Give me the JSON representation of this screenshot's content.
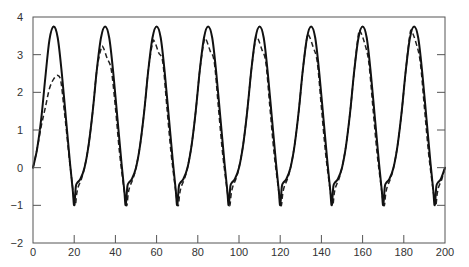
{
  "chart_data": {
    "type": "line",
    "title": "",
    "xlabel": "",
    "ylabel": "",
    "xlim": [
      0,
      200
    ],
    "ylim": [
      -2,
      4
    ],
    "grid": false,
    "legend": null,
    "x_ticks": [
      0,
      20,
      40,
      60,
      80,
      100,
      120,
      140,
      160,
      180,
      200
    ],
    "x_tick_labels": [
      "0",
      "20",
      "40",
      "60",
      "80",
      "100",
      "120",
      "140",
      "160",
      "180",
      "200"
    ],
    "y_ticks": [
      -2,
      -1,
      0,
      1,
      2,
      3,
      4
    ],
    "y_tick_labels": [
      "−2",
      "−1",
      "0",
      "1",
      "2",
      "3",
      "4"
    ],
    "series": [
      {
        "name": "solid",
        "style": "solid",
        "color": "#111111",
        "points": [
          [
            0,
            0
          ],
          [
            2,
            0.5
          ],
          [
            4,
            1.3
          ],
          [
            6,
            2.4
          ],
          [
            8,
            3.4
          ],
          [
            10,
            3.75
          ],
          [
            12,
            3.45
          ],
          [
            14,
            2.5
          ],
          [
            16,
            1.3
          ],
          [
            18,
            0.1
          ],
          [
            19.3,
            -0.6
          ],
          [
            20,
            -1.0
          ],
          [
            20.8,
            -0.5
          ],
          [
            21.5,
            -0.4
          ],
          [
            23,
            -0.3
          ],
          [
            25,
            0.0
          ],
          [
            27,
            0.6
          ],
          [
            29,
            1.5
          ],
          [
            31,
            2.6
          ],
          [
            33,
            3.45
          ],
          [
            35,
            3.75
          ],
          [
            37,
            3.45
          ],
          [
            39,
            2.5
          ],
          [
            41,
            1.3
          ],
          [
            43,
            0.1
          ],
          [
            44.3,
            -0.6
          ],
          [
            45,
            -1.0
          ],
          [
            45.8,
            -0.5
          ],
          [
            46.5,
            -0.4
          ],
          [
            48,
            -0.3
          ],
          [
            50,
            0.0
          ],
          [
            52,
            0.6
          ],
          [
            54,
            1.5
          ],
          [
            56,
            2.6
          ],
          [
            58,
            3.45
          ],
          [
            60,
            3.75
          ],
          [
            62,
            3.45
          ],
          [
            64,
            2.5
          ],
          [
            66,
            1.3
          ],
          [
            68,
            0.1
          ],
          [
            69.3,
            -0.6
          ],
          [
            70,
            -1.0
          ],
          [
            70.8,
            -0.5
          ],
          [
            71.5,
            -0.4
          ],
          [
            73,
            -0.3
          ],
          [
            75,
            0.0
          ],
          [
            77,
            0.6
          ],
          [
            79,
            1.5
          ],
          [
            81,
            2.6
          ],
          [
            83,
            3.45
          ],
          [
            85,
            3.75
          ],
          [
            87,
            3.45
          ],
          [
            89,
            2.5
          ],
          [
            91,
            1.3
          ],
          [
            93,
            0.1
          ],
          [
            94.3,
            -0.6
          ],
          [
            95,
            -1.0
          ],
          [
            95.8,
            -0.5
          ],
          [
            96.5,
            -0.4
          ],
          [
            98,
            -0.3
          ],
          [
            100,
            0.0
          ],
          [
            102,
            0.6
          ],
          [
            104,
            1.5
          ],
          [
            106,
            2.6
          ],
          [
            108,
            3.45
          ],
          [
            110,
            3.75
          ],
          [
            112,
            3.45
          ],
          [
            114,
            2.5
          ],
          [
            116,
            1.3
          ],
          [
            118,
            0.1
          ],
          [
            119.3,
            -0.6
          ],
          [
            120,
            -1.0
          ],
          [
            120.8,
            -0.5
          ],
          [
            121.5,
            -0.4
          ],
          [
            123,
            -0.3
          ],
          [
            125,
            0.0
          ],
          [
            127,
            0.6
          ],
          [
            129,
            1.5
          ],
          [
            131,
            2.6
          ],
          [
            133,
            3.45
          ],
          [
            135,
            3.75
          ],
          [
            137,
            3.45
          ],
          [
            139,
            2.5
          ],
          [
            141,
            1.3
          ],
          [
            143,
            0.1
          ],
          [
            144.3,
            -0.6
          ],
          [
            145,
            -1.0
          ],
          [
            145.8,
            -0.5
          ],
          [
            146.5,
            -0.4
          ],
          [
            148,
            -0.3
          ],
          [
            150,
            0.0
          ],
          [
            152,
            0.6
          ],
          [
            154,
            1.5
          ],
          [
            156,
            2.6
          ],
          [
            158,
            3.45
          ],
          [
            160,
            3.75
          ],
          [
            162,
            3.45
          ],
          [
            164,
            2.5
          ],
          [
            166,
            1.3
          ],
          [
            168,
            0.1
          ],
          [
            169.3,
            -0.6
          ],
          [
            170,
            -1.0
          ],
          [
            170.8,
            -0.5
          ],
          [
            171.5,
            -0.4
          ],
          [
            173,
            -0.3
          ],
          [
            175,
            0.0
          ],
          [
            177,
            0.6
          ],
          [
            179,
            1.5
          ],
          [
            181,
            2.6
          ],
          [
            183,
            3.45
          ],
          [
            185,
            3.75
          ],
          [
            187,
            3.45
          ],
          [
            189,
            2.5
          ],
          [
            191,
            1.3
          ],
          [
            193,
            0.1
          ],
          [
            194.3,
            -0.6
          ],
          [
            195,
            -1.0
          ],
          [
            195.8,
            -0.5
          ],
          [
            196.5,
            -0.4
          ],
          [
            198,
            -0.3
          ],
          [
            200,
            0.0
          ]
        ]
      },
      {
        "name": "dashed",
        "style": "dashed",
        "color": "#222222",
        "points": [
          [
            0,
            0
          ],
          [
            2,
            0.5
          ],
          [
            4,
            1.1
          ],
          [
            6,
            1.6
          ],
          [
            8,
            2.1
          ],
          [
            10,
            2.35
          ],
          [
            12,
            2.45
          ],
          [
            13.5,
            2.3
          ],
          [
            15,
            1.6
          ],
          [
            16,
            1.1
          ],
          [
            17.5,
            0.3
          ],
          [
            19,
            -0.4
          ],
          [
            20,
            -0.9
          ],
          [
            20.6,
            -1.0
          ],
          [
            21.2,
            -0.7
          ],
          [
            22,
            -0.5
          ],
          [
            23.5,
            -0.3
          ],
          [
            25,
            0.0
          ],
          [
            27,
            0.6
          ],
          [
            29,
            1.5
          ],
          [
            31,
            2.6
          ],
          [
            33,
            3.15
          ],
          [
            34,
            3.2
          ],
          [
            36,
            2.9
          ],
          [
            38,
            2.6
          ],
          [
            40,
            1.6
          ],
          [
            42,
            0.4
          ],
          [
            44,
            -0.5
          ],
          [
            45,
            -0.9
          ],
          [
            45.6,
            -1.0
          ],
          [
            46.2,
            -0.7
          ],
          [
            47,
            -0.5
          ],
          [
            48.5,
            -0.3
          ],
          [
            50,
            0.0
          ],
          [
            52,
            0.6
          ],
          [
            54,
            1.5
          ],
          [
            56,
            2.6
          ],
          [
            58,
            3.3
          ],
          [
            59,
            3.35
          ],
          [
            61,
            3.05
          ],
          [
            63,
            2.8
          ],
          [
            65,
            1.6
          ],
          [
            67,
            0.4
          ],
          [
            69,
            -0.5
          ],
          [
            70,
            -0.9
          ],
          [
            70.6,
            -1.0
          ],
          [
            71.2,
            -0.7
          ],
          [
            72,
            -0.5
          ],
          [
            73.5,
            -0.3
          ],
          [
            75,
            0.0
          ],
          [
            77,
            0.6
          ],
          [
            79,
            1.5
          ],
          [
            81,
            2.6
          ],
          [
            83,
            3.35
          ],
          [
            84,
            3.4
          ],
          [
            86,
            3.1
          ],
          [
            88,
            2.8
          ],
          [
            90,
            1.6
          ],
          [
            92,
            0.4
          ],
          [
            94,
            -0.5
          ],
          [
            95,
            -0.9
          ],
          [
            95.6,
            -1.0
          ],
          [
            96.2,
            -0.7
          ],
          [
            97,
            -0.5
          ],
          [
            98.5,
            -0.3
          ],
          [
            100,
            0.0
          ],
          [
            102,
            0.6
          ],
          [
            104,
            1.5
          ],
          [
            106,
            2.6
          ],
          [
            108,
            3.4
          ],
          [
            109,
            3.45
          ],
          [
            111,
            3.15
          ],
          [
            113,
            2.8
          ],
          [
            115,
            1.6
          ],
          [
            117,
            0.4
          ],
          [
            119,
            -0.5
          ],
          [
            120,
            -0.9
          ],
          [
            120.6,
            -1.0
          ],
          [
            121.2,
            -0.7
          ],
          [
            122,
            -0.5
          ],
          [
            123.5,
            -0.3
          ],
          [
            125,
            0.0
          ],
          [
            127,
            0.6
          ],
          [
            129,
            1.5
          ],
          [
            131,
            2.6
          ],
          [
            133,
            3.45
          ],
          [
            134,
            3.5
          ],
          [
            136,
            3.2
          ],
          [
            138,
            2.8
          ],
          [
            140,
            1.6
          ],
          [
            142,
            0.4
          ],
          [
            144,
            -0.5
          ],
          [
            145,
            -0.9
          ],
          [
            145.6,
            -1.0
          ],
          [
            146.2,
            -0.7
          ],
          [
            147,
            -0.5
          ],
          [
            148.5,
            -0.3
          ],
          [
            150,
            0.0
          ],
          [
            152,
            0.6
          ],
          [
            154,
            1.5
          ],
          [
            156,
            2.6
          ],
          [
            158,
            3.55
          ],
          [
            159,
            3.6
          ],
          [
            161,
            3.3
          ],
          [
            163,
            2.8
          ],
          [
            165,
            1.6
          ],
          [
            167,
            0.4
          ],
          [
            169,
            -0.5
          ],
          [
            170,
            -0.9
          ],
          [
            170.6,
            -1.0
          ],
          [
            171.2,
            -0.7
          ],
          [
            172,
            -0.5
          ],
          [
            173.5,
            -0.3
          ],
          [
            175,
            0.0
          ],
          [
            177,
            0.6
          ],
          [
            179,
            1.5
          ],
          [
            181,
            2.6
          ],
          [
            183,
            3.55
          ],
          [
            184,
            3.6
          ],
          [
            186,
            3.3
          ],
          [
            188,
            2.8
          ],
          [
            190,
            1.6
          ],
          [
            192,
            0.4
          ],
          [
            194,
            -0.5
          ],
          [
            195,
            -0.9
          ],
          [
            195.6,
            -1.0
          ],
          [
            196.2,
            -0.7
          ],
          [
            197,
            -0.5
          ],
          [
            198.5,
            -0.3
          ],
          [
            200,
            0.0
          ]
        ]
      }
    ]
  },
  "layout": {
    "plot_left": 33,
    "plot_right": 445,
    "plot_top": 17,
    "plot_bottom": 243
  }
}
